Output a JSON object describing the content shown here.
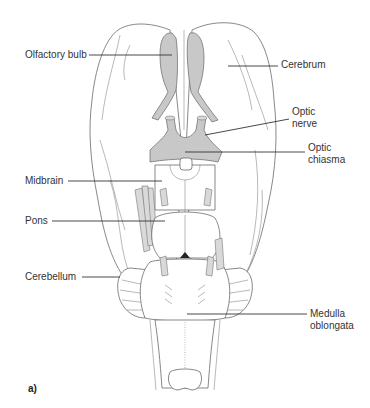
{
  "figure": {
    "panel_label": "a)",
    "labels": {
      "olfactory_bulb": "Olfactory bulb",
      "cerebrum": "Cerebrum",
      "optic_nerve": "Optic\nnerve",
      "optic_chiasma": "Optic\nchiasma",
      "midbrain": "Midbrain",
      "pons": "Pons",
      "cerebellum": "Cerebellum",
      "medulla_oblongata": "Medulla\noblongata"
    },
    "colors": {
      "structure_shade": "#c8c8c8",
      "outline": "#6a6a6a",
      "text": "#333333"
    }
  }
}
